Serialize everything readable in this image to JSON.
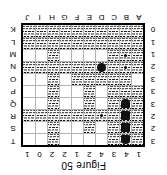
{
  "figure": {
    "caption": "Figure 50",
    "orientation": "rotated-180"
  },
  "board": {
    "columns": 10,
    "rows": 10,
    "column_clues": [
      "1",
      "4",
      "3",
      "4",
      "2",
      "1",
      "2",
      "2",
      "0",
      "1"
    ],
    "row_clues": [
      "3",
      "2",
      "2",
      "3",
      "3",
      "3",
      "2",
      "1",
      "1",
      "0"
    ],
    "column_letters": [
      "A",
      "B",
      "C",
      "D",
      "E",
      "F",
      "G",
      "H",
      "I",
      "J"
    ],
    "row_letters": [
      "T",
      "S",
      "R",
      "Q",
      "P",
      "O",
      "N",
      "M",
      "L",
      "K"
    ],
    "cells": [
      [
        "water",
        "ship-end-top",
        "water",
        "empty",
        "empty",
        "empty",
        "empty",
        "water",
        "empty",
        "empty"
      ],
      [
        "water",
        "ship-mid",
        "water",
        "empty",
        "water",
        "empty",
        "empty",
        "water",
        "empty",
        "empty"
      ],
      [
        "water",
        "ship-mid",
        "water",
        "dot",
        "water",
        "water",
        "water",
        "water",
        "water",
        "water"
      ],
      [
        "water",
        "ship-end-bottom",
        "water",
        "empty",
        "water",
        "empty",
        "empty",
        "water",
        "empty",
        "empty"
      ],
      [
        "water",
        "water",
        "water",
        "empty",
        "water",
        "empty",
        "empty",
        "water",
        "empty",
        "empty"
      ],
      [
        "empty",
        "water",
        "water",
        "water",
        "water",
        "water",
        "empty",
        "water",
        "empty",
        "empty"
      ],
      [
        "water",
        "dot",
        "water",
        "sub",
        "water",
        "water",
        "water",
        "water",
        "water",
        "water"
      ],
      [
        "water",
        "dot",
        "water",
        "empty",
        "empty",
        "empty",
        "empty",
        "water",
        "empty",
        "empty"
      ],
      [
        "water",
        "water",
        "water",
        "water",
        "water",
        "water",
        "water",
        "water",
        "water",
        "water"
      ],
      [
        "water",
        "water",
        "water",
        "water",
        "water",
        "water",
        "water",
        "water",
        "water",
        "water"
      ]
    ]
  },
  "colors": {
    "ink": "#000000",
    "grid_line": "#b5b5b5",
    "paper": "#ffffff",
    "ship": "#111111"
  }
}
